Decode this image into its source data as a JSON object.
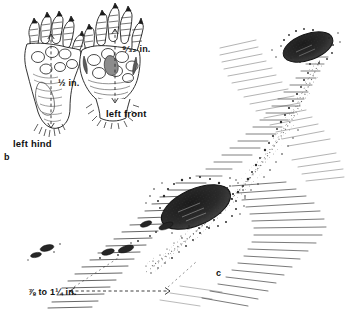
{
  "figure": {
    "kind": "field-guide-illustration",
    "background_color": "#ffffff",
    "ink_color": "#1a1a1a"
  },
  "panels": [
    {
      "id": "b",
      "label": "b",
      "content": "paw prints"
    },
    {
      "id": "c",
      "label": "c",
      "content": "mole hills and surface ridge"
    }
  ],
  "paws": [
    {
      "id": "left-hind",
      "label": "left hind",
      "measurement": {
        "value": "1/2",
        "unit": "in.",
        "display": "½ in."
      }
    },
    {
      "id": "left-front",
      "label": "left front",
      "measurement": {
        "value": "9/32",
        "unit": "in.",
        "display": "⁹⁄₃₂ in."
      }
    }
  ],
  "trail": {
    "measurement": {
      "from": "7/8",
      "to": "1 1/4",
      "unit": "in.",
      "display": "⅞ to 1¼ in."
    },
    "mounds": 2,
    "ridge_direction": "lower-left to upper-right"
  },
  "measurement_labels": {
    "hind": "½ in.",
    "front": "⁹⁄₃₂ in.",
    "trail": "⅞ to 1¼ in."
  }
}
